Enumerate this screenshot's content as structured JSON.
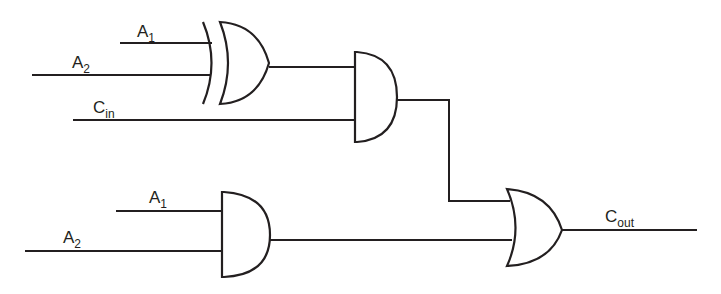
{
  "diagram": {
    "type": "logic-circuit",
    "labels": {
      "xor_a1": {
        "main": "A",
        "sub": "1"
      },
      "xor_a2": {
        "main": "A",
        "sub": "2"
      },
      "cin": {
        "main": "C",
        "sub": "in"
      },
      "and_a1": {
        "main": "A",
        "sub": "1"
      },
      "and_a2": {
        "main": "A",
        "sub": "2"
      },
      "cout": {
        "main": "C",
        "sub": "out"
      }
    },
    "gates": [
      {
        "id": "xor1",
        "type": "XOR",
        "inputs": [
          "A1",
          "A2"
        ]
      },
      {
        "id": "and1",
        "type": "AND",
        "inputs": [
          "xor1",
          "Cin"
        ]
      },
      {
        "id": "and2",
        "type": "AND",
        "inputs": [
          "A1",
          "A2"
        ]
      },
      {
        "id": "or1",
        "type": "OR",
        "inputs": [
          "and1",
          "and2"
        ],
        "output": "Cout"
      }
    ],
    "colors": {
      "stroke": "#231f20",
      "background": "#ffffff"
    }
  }
}
